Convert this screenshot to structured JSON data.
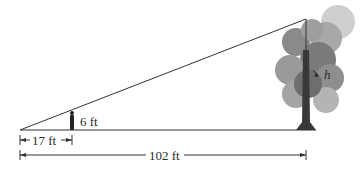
{
  "diagram": {
    "type": "similar-triangles",
    "labels": {
      "person_height": "6 ft",
      "person_distance": "17 ft",
      "tree_distance": "102 ft",
      "tree_height": "h"
    },
    "colors": {
      "line": "#333333",
      "foliage_dark": "#6e6e6e",
      "foliage_mid": "#9a9a9a",
      "foliage_light": "#c4c4c4",
      "trunk": "#3a3a3a"
    }
  }
}
